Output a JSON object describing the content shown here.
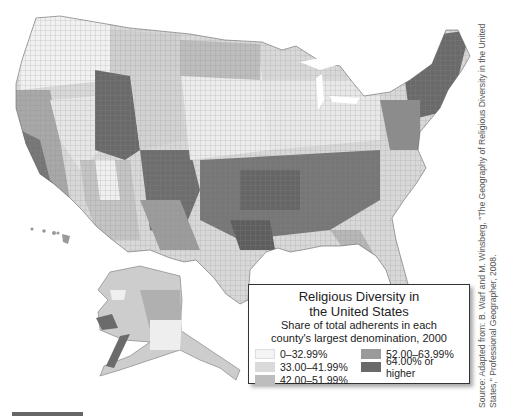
{
  "legend": {
    "title_line1": "Religious Diversity in",
    "title_line2": "the United States",
    "subtitle_line1": "Share of total adherents in each",
    "subtitle_line2": "county's largest denomination, 2000",
    "classes": [
      {
        "label": "0–32.99%",
        "color": "#f4f4f4"
      },
      {
        "label": "33.00–41.99%",
        "color": "#dadada"
      },
      {
        "label": "42.00–51.99%",
        "color": "#bdbdbd"
      },
      {
        "label": "52.00–63.99%",
        "color": "#9a9a9a"
      },
      {
        "label": "64.00% or higher",
        "color": "#6a6a6a"
      }
    ]
  },
  "source": {
    "line1": "Source: Adapted from: B. Warf and M. Winsberg, \"The Geography of Religious Diversity in the United",
    "line2": "States,\" Professional Geographer, 2008."
  },
  "map": {
    "subject": "Choropleth map of US counties (contiguous US, Alaska, Hawaii)",
    "regions": [
      "contiguous-us",
      "alaska",
      "hawaii"
    ]
  }
}
